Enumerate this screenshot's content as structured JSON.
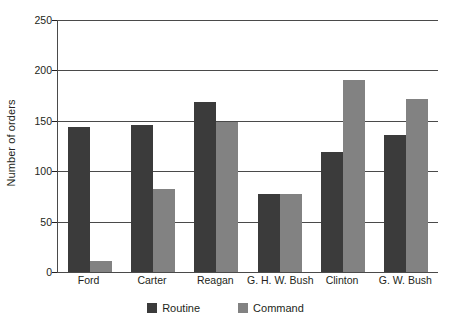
{
  "chart_data": {
    "type": "bar",
    "title": "",
    "xlabel": "",
    "ylabel": "Number of orders",
    "ylim": [
      0,
      250
    ],
    "yticks": [
      0,
      50,
      100,
      150,
      200,
      250
    ],
    "ytick_labels": [
      "0",
      "50",
      "100",
      "150",
      "200",
      "250"
    ],
    "grid": true,
    "legend_position": "bottom-center",
    "categories": [
      "Ford",
      "Carter",
      "Reagan",
      "G. H. W. Bush",
      "Clinton",
      "G. W. Bush"
    ],
    "series": [
      {
        "name": "Routine",
        "color": "#3b3b3b",
        "values": [
          144,
          146,
          169,
          77,
          119,
          136
        ]
      },
      {
        "name": "Command",
        "color": "#828282",
        "values": [
          11,
          82,
          149,
          77,
          190,
          172
        ]
      }
    ]
  },
  "axis": {
    "y_title": "Number of orders"
  },
  "legend": {
    "items": [
      {
        "label": "Routine",
        "swatch": "routine-swatch"
      },
      {
        "label": "Command",
        "swatch": "command-swatch"
      }
    ]
  }
}
